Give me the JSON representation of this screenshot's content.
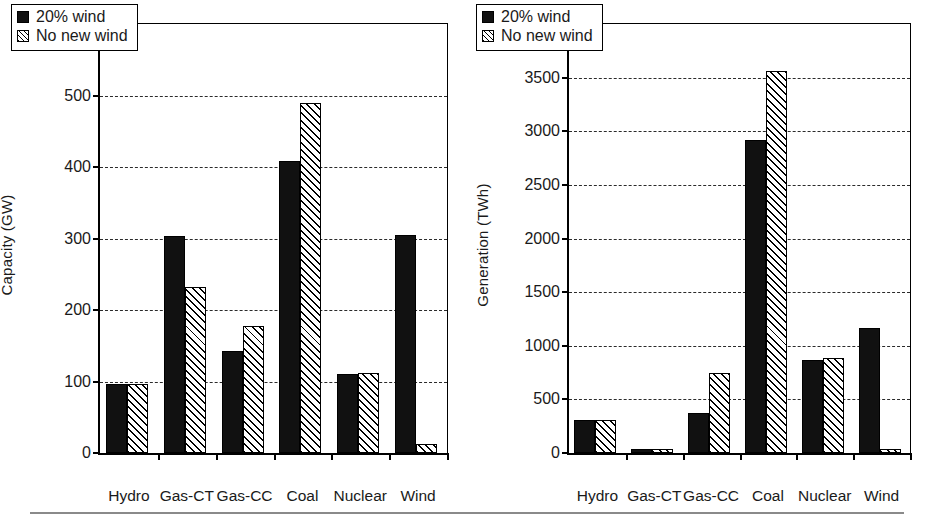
{
  "figure": {
    "background": "#ffffff",
    "series_colors": {
      "solid": "#111111",
      "hatch_line": "#000000",
      "hatch_bg": "#ffffff"
    },
    "bottom_rule_color": "#8a8a8a"
  },
  "legend": {
    "entries": [
      {
        "label": "20% wind",
        "style": "solid"
      },
      {
        "label": "No new wind",
        "style": "hatch"
      }
    ]
  },
  "chart_data": [
    {
      "type": "bar",
      "panel": "left",
      "title": "",
      "xlabel": "",
      "ylabel": "Capacity (GW)",
      "ylim": [
        0,
        600
      ],
      "yticks": [
        0,
        100,
        200,
        300,
        400,
        500,
        600
      ],
      "grid": true,
      "grid_axis": "y",
      "legend_position": "top-left",
      "categories": [
        "Hydro",
        "Gas-CT",
        "Gas-CC",
        "Coal",
        "Nuclear",
        "Wind"
      ],
      "series": [
        {
          "name": "20% wind",
          "values": [
            96,
            304,
            143,
            408,
            110,
            305
          ]
        },
        {
          "name": "No new wind",
          "values": [
            96,
            232,
            178,
            489,
            112,
            13
          ]
        }
      ]
    },
    {
      "type": "bar",
      "panel": "right",
      "title": "",
      "xlabel": "",
      "ylabel": "Generation (TWh)",
      "ylim": [
        0,
        4000
      ],
      "yticks": [
        0,
        500,
        1000,
        1500,
        2000,
        2500,
        3000,
        3500,
        4000
      ],
      "grid": true,
      "grid_axis": "y",
      "legend_position": "top-left",
      "categories": [
        "Hydro",
        "Gas-CT",
        "Gas-CC",
        "Coal",
        "Nuclear",
        "Wind"
      ],
      "series": [
        {
          "name": "20% wind",
          "values": [
            310,
            40,
            370,
            2915,
            865,
            1170
          ]
        },
        {
          "name": "No new wind",
          "values": [
            310,
            33,
            750,
            3560,
            885,
            35
          ]
        }
      ]
    }
  ]
}
